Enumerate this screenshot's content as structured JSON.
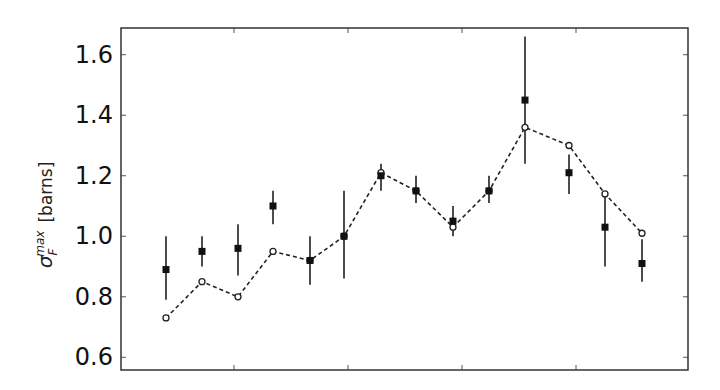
{
  "chart_data": {
    "type": "scatter",
    "title": "",
    "xlabel": "",
    "ylabel": "σ_F^max [barns]",
    "ylabel_parts": {
      "symbol": "σ",
      "subscript": "F",
      "superscript": "max",
      "unit": "[barns]"
    },
    "ylim": [
      0.57,
      1.68
    ],
    "yticks": [
      0.6,
      0.8,
      1.0,
      1.2,
      1.4,
      1.6
    ],
    "ytick_labels": [
      "0.6",
      "0.8",
      "1.0",
      "1.2",
      "1.4",
      "1.6"
    ],
    "xticks_unlabeled": 4,
    "grid": false,
    "legend": null,
    "x": [
      1,
      2,
      3,
      4,
      5,
      6,
      7,
      8,
      9,
      10,
      11,
      12,
      13,
      14
    ],
    "series": [
      {
        "name": "measured",
        "marker": "filled-square",
        "line": "none",
        "values": [
          0.89,
          0.95,
          0.96,
          1.1,
          0.92,
          1.0,
          1.2,
          1.15,
          1.05,
          1.15,
          1.45,
          1.21,
          1.03,
          0.91
        ],
        "error_low": [
          0.79,
          0.9,
          0.87,
          1.04,
          0.84,
          0.86,
          1.15,
          1.11,
          1.0,
          1.11,
          1.24,
          1.14,
          0.9,
          0.85
        ],
        "error_high": [
          1.0,
          1.0,
          1.04,
          1.15,
          1.0,
          1.15,
          1.24,
          1.2,
          1.1,
          1.2,
          1.66,
          1.27,
          1.14,
          0.99
        ]
      },
      {
        "name": "calculated",
        "marker": "open-circle",
        "line": "dashed",
        "values": [
          0.73,
          0.85,
          0.8,
          0.95,
          0.92,
          1.0,
          1.21,
          1.15,
          1.03,
          1.15,
          1.36,
          1.3,
          1.14,
          1.01
        ]
      }
    ],
    "x_pixels": [
      166,
      202,
      238,
      273,
      310,
      344,
      381,
      416,
      453,
      489,
      525,
      569,
      605,
      642
    ]
  }
}
